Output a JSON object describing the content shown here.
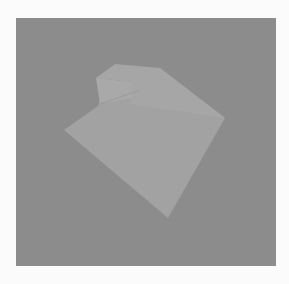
{
  "scene": {
    "background_color": "#fbfbfb",
    "panel_color": "#8c8c8c",
    "shape": {
      "top_face_color": "#a6a6a6",
      "main_face_color": "#a2a2a2",
      "box_face_color": "#a9a9a9",
      "box_shadow_edge_color": "#9a9a9a",
      "main_face_points": "64,130 98,106 100,100 160,68 225,118 168,218",
      "top_face_points": "96,78 115,64 160,68 225,118 130,104 132,82",
      "box_face_points": "96,78 132,82 132,98 100,104"
    }
  }
}
